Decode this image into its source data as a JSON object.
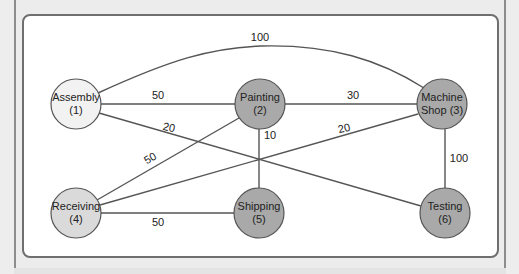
{
  "colors": {
    "node_assembly": "#f2f2f2",
    "node_receiving": "#dadada",
    "node_default": "#a9a9a9",
    "edge": "#555555"
  },
  "nodes": [
    {
      "id": 1,
      "line1": "Assembly",
      "line2": "(1)",
      "x": 76,
      "y": 104
    },
    {
      "id": 2,
      "line1": "Painting",
      "line2": "(2)",
      "x": 260,
      "y": 104
    },
    {
      "id": 3,
      "line1": "Machine",
      "line2": "Shop (3)",
      "x": 442,
      "y": 104
    },
    {
      "id": 4,
      "line1": "Receiving",
      "line2": "(4)",
      "x": 76,
      "y": 213
    },
    {
      "id": 5,
      "line1": "Shipping",
      "line2": "(5)",
      "x": 259,
      "y": 213
    },
    {
      "id": 6,
      "line1": "Testing",
      "line2": "(6)",
      "x": 445,
      "y": 213
    }
  ],
  "edges": [
    {
      "from": 1,
      "to": 3,
      "weight": "100"
    },
    {
      "from": 1,
      "to": 2,
      "weight": "50"
    },
    {
      "from": 1,
      "to": 6,
      "weight": "20"
    },
    {
      "from": 2,
      "to": 3,
      "weight": "30"
    },
    {
      "from": 2,
      "to": 4,
      "weight": "50"
    },
    {
      "from": 2,
      "to": 5,
      "weight": "10"
    },
    {
      "from": 3,
      "to": 4,
      "weight": "20"
    },
    {
      "from": 3,
      "to": 6,
      "weight": "100"
    },
    {
      "from": 4,
      "to": 5,
      "weight": "50"
    }
  ]
}
